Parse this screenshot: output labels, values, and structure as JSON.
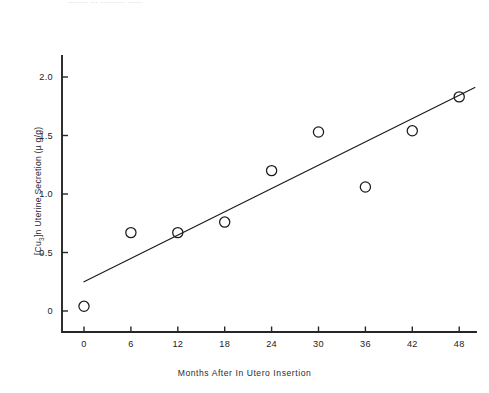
{
  "figure": {
    "top_clipped_text": "........ ... .......... ......",
    "background_color": "#ffffff",
    "ink_color": "#1c1c1c"
  },
  "chart_data": {
    "type": "scatter",
    "title": "",
    "subtitle": "",
    "xlabel": "Months After In Utero Insertion",
    "ylabel": "[Cu3]n Uterine Secretion (µ g/g)",
    "ylabel_parts": {
      "prefix": "[Cu",
      "sub": "3",
      "middle": "]n Uterine Secretion (",
      "mu": "µ",
      "suffix": " g/g)"
    },
    "x": [
      0,
      6,
      12,
      18,
      24,
      30,
      36,
      42,
      48
    ],
    "values": [
      0.04,
      0.67,
      0.67,
      0.76,
      1.2,
      1.53,
      1.06,
      1.54,
      1.83
    ],
    "series": [
      {
        "name": "Uterine secretion",
        "marker": "open-circle",
        "x": [
          0,
          6,
          12,
          18,
          24,
          30,
          36,
          42,
          48
        ],
        "values": [
          0.04,
          0.67,
          0.67,
          0.76,
          1.2,
          1.53,
          1.06,
          1.54,
          1.83
        ]
      },
      {
        "name": "Linear regression line",
        "marker": "none",
        "x": [
          0,
          50
        ],
        "values": [
          0.25,
          1.91
        ]
      }
    ],
    "xlim": [
      -1.8,
      50.5
    ],
    "ylim": [
      -0.18,
      2.18
    ],
    "xticks": [
      0,
      6,
      12,
      18,
      24,
      30,
      36,
      42,
      48
    ],
    "xticklabels": [
      "0",
      "6",
      "12",
      "18",
      "24",
      "30",
      "36",
      "42",
      "48"
    ],
    "yticks": [
      0,
      0.5,
      1.0,
      1.5,
      2.0
    ],
    "yticklabels": [
      "0",
      "0.5",
      "1.0",
      "1.5",
      "2.0"
    ],
    "grid": false,
    "legend": false,
    "legend_position": "none"
  }
}
